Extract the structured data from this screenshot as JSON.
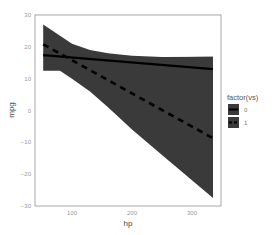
{
  "chart_data": {
    "type": "line",
    "title": "",
    "xlabel": "hp",
    "ylabel": "mpg",
    "xlim": [
      40,
      340
    ],
    "ylim": [
      -30,
      30
    ],
    "xticks": [
      100,
      200,
      300
    ],
    "yticks": [
      30,
      20,
      10,
      0,
      -10,
      -20,
      -30
    ],
    "grid": false,
    "legend": {
      "title": "factor(vs)",
      "position": "right",
      "entries": [
        "0",
        "1"
      ]
    },
    "series": [
      {
        "name": "0",
        "linestyle": "solid",
        "x": [
          52,
          335
        ],
        "values": [
          17.4,
          13.0
        ],
        "ribbon_upper": {
          "x": [
            52,
            100,
            150,
            200,
            250,
            335
          ],
          "values": [
            18.0,
            17.6,
            17.1,
            16.8,
            16.7,
            16.9
          ]
        },
        "ribbon_lower": {
          "x": [
            52,
            100,
            150,
            200,
            250,
            335
          ],
          "values": [
            16.8,
            16.4,
            15.6,
            14.6,
            13.0,
            9.0
          ]
        }
      },
      {
        "name": "1",
        "linestyle": "dashed",
        "x": [
          52,
          335
        ],
        "values": [
          20.8,
          -8.7
        ],
        "ribbon_upper": {
          "x": [
            52,
            80,
            100,
            130,
            160,
            200,
            250,
            335
          ],
          "values": [
            27.0,
            23.5,
            21.0,
            19.0,
            18.0,
            17.2,
            16.8,
            16.9
          ]
        },
        "ribbon_lower": {
          "x": [
            52,
            80,
            100,
            130,
            160,
            200,
            250,
            335
          ],
          "values": [
            12.5,
            12.5,
            10.0,
            6.0,
            1.0,
            -6.0,
            -14.0,
            -27.5
          ]
        }
      }
    ]
  },
  "axis": {
    "x_label": "hp",
    "y_label": "mpg",
    "x_ticks": [
      "100",
      "200",
      "300"
    ],
    "y_ticks": [
      "30",
      "20",
      "10",
      "0",
      "-10",
      "-20",
      "-30"
    ]
  },
  "legend": {
    "title": "factor(vs)",
    "items": [
      {
        "label": "0"
      },
      {
        "label": "1"
      }
    ]
  },
  "colors": {
    "ribbon": "#3a3a3a",
    "line": "#000000",
    "panel_border": "#a8a8a8"
  }
}
